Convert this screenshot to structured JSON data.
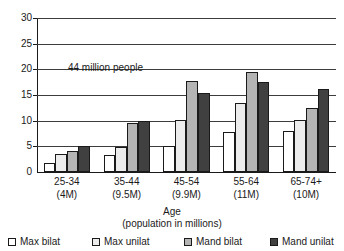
{
  "chart_data": {
    "type": "bar",
    "title": "",
    "xlabel": "Age",
    "xlabel_sub": "(population in millions)",
    "ylabel": "",
    "ylim": [
      0,
      30
    ],
    "yticks": [
      0,
      5,
      10,
      15,
      20,
      25,
      30
    ],
    "grid": true,
    "legend_position": "bottom",
    "categories": [
      "25-34",
      "35-44",
      "45-54",
      "55-64",
      "65-74+"
    ],
    "category_sublabels": [
      "(4M)",
      "(9.5M)",
      "(9.9M)",
      "(11M)",
      "(10M)"
    ],
    "series": [
      {
        "name": "Max bilat",
        "color": "#ffffff",
        "values": [
          1.8,
          3.4,
          5.1,
          7.8,
          8.0
        ]
      },
      {
        "name": "Max unilat",
        "color": "#ececec",
        "values": [
          3.5,
          4.9,
          10.1,
          13.4,
          10.2
        ]
      },
      {
        "name": "Mand bilat",
        "color": "#b4b4b4",
        "values": [
          4.0,
          9.5,
          17.8,
          19.5,
          12.5
        ]
      },
      {
        "name": "Mand unilat",
        "color": "#404040",
        "values": [
          5.1,
          10.0,
          15.3,
          17.6,
          16.1
        ]
      }
    ],
    "annotations": [
      {
        "text": "44 million people",
        "x_value": 0.35,
        "y_value": 21.5
      }
    ]
  },
  "legend": {
    "items": [
      {
        "label": "Max bilat",
        "color": "#ffffff"
      },
      {
        "label": "Max unilat",
        "color": "#ececec"
      },
      {
        "label": "Mand bilat",
        "color": "#b4b4b4"
      },
      {
        "label": "Mand unilat",
        "color": "#404040"
      }
    ]
  },
  "colors": {
    "axis": "#1a1a1a",
    "grid": "#3c3c3c",
    "background": "#ffffff"
  }
}
